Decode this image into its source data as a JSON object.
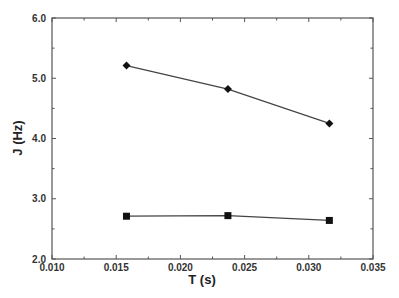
{
  "chart_data": {
    "type": "line",
    "title": "",
    "xlabel": "T (s)",
    "ylabel": "J (Hz)",
    "xlim": [
      0.01,
      0.035
    ],
    "ylim": [
      2.0,
      6.0
    ],
    "x_ticks": [
      "0.010",
      "0.015",
      "0.020",
      "0.025",
      "0.030",
      "0.035"
    ],
    "y_ticks": [
      "2.0",
      "3.0",
      "4.0",
      "5.0",
      "6.0"
    ],
    "grid": false,
    "legend": null,
    "x": [
      0.0158,
      0.0237,
      0.0316
    ],
    "series": [
      {
        "name": "diamonds",
        "marker": "diamond",
        "values": [
          5.21,
          4.82,
          4.25
        ]
      },
      {
        "name": "squares",
        "marker": "square",
        "values": [
          2.71,
          2.72,
          2.64
        ]
      }
    ]
  },
  "colors": {
    "axis": "#555555",
    "line": "#444444",
    "marker": "#111111",
    "background": "#ffffff"
  }
}
